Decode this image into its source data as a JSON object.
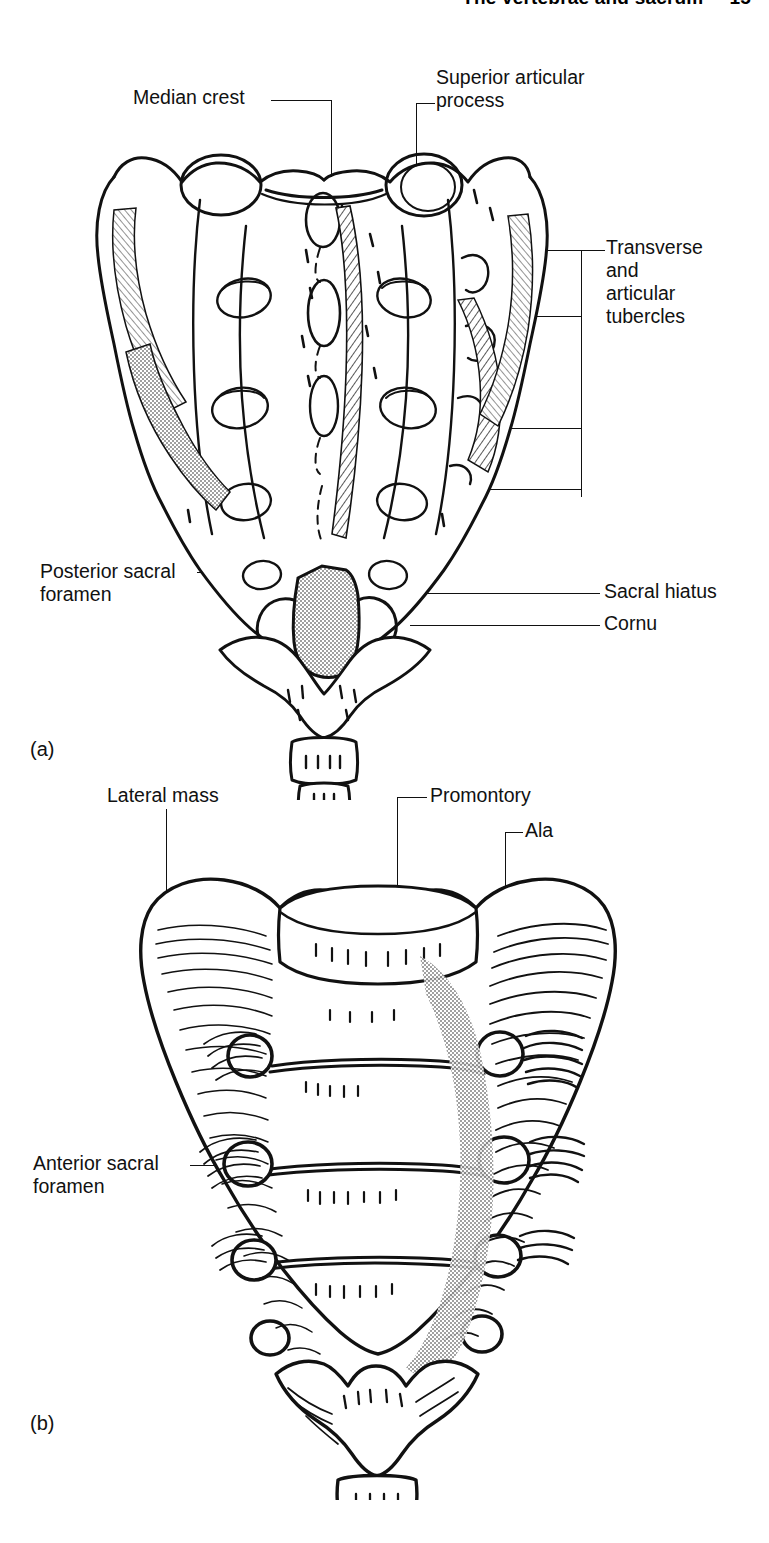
{
  "page": {
    "running_head": {
      "title": "The vertebrae and sacrum",
      "page_number": "15"
    },
    "width": 769,
    "height": 1543,
    "background": "#ffffff",
    "ink": "#000000"
  },
  "figure": {
    "caption_ids": {
      "panel_a": "(a)",
      "panel_b": "(b)"
    },
    "panels": [
      {
        "id": "(a)",
        "view": "posterior surface of sacrum and coccyx",
        "labels": [
          {
            "name": "median-crest",
            "text": "Median crest"
          },
          {
            "name": "superior-articular-process",
            "text": "Superior articular\nprocess",
            "lines": [
              "Superior articular",
              "process"
            ]
          },
          {
            "name": "transverse-and-articular-tubercles",
            "text": "Transverse\nand\narticular\ntubercles",
            "lines": [
              "Transverse",
              "and",
              "articular",
              "tubercles"
            ]
          },
          {
            "name": "posterior-sacral-foramen",
            "text": "Posterior sacral\nforamen",
            "lines": [
              "Posterior sacral",
              "foramen"
            ]
          },
          {
            "name": "sacral-hiatus",
            "text": "Sacral hiatus"
          },
          {
            "name": "cornu",
            "text": "Cornu"
          }
        ]
      },
      {
        "id": "(b)",
        "view": "anterior (pelvic) surface of sacrum and coccyx",
        "labels": [
          {
            "name": "lateral-mass",
            "text": "Lateral mass"
          },
          {
            "name": "promontory",
            "text": "Promontory"
          },
          {
            "name": "ala",
            "text": "Ala"
          },
          {
            "name": "anterior-sacral-foramen",
            "text": "Anterior sacral\nforamen",
            "lines": [
              "Anterior sacral",
              "foramen"
            ]
          }
        ]
      }
    ]
  },
  "label_text": {
    "median_crest": "Median crest",
    "superior_articular_1": "Superior articular",
    "superior_articular_2": "process",
    "transverse_1": "Transverse",
    "transverse_2": "and",
    "transverse_3": "articular",
    "transverse_4": "tubercles",
    "posterior_sacral_1": "Posterior sacral",
    "posterior_sacral_2": "foramen",
    "sacral_hiatus": "Sacral hiatus",
    "cornu": "Cornu",
    "lateral_mass": "Lateral mass",
    "promontory": "Promontory",
    "ala": "Ala",
    "anterior_sacral_1": "Anterior sacral",
    "anterior_sacral_2": "foramen",
    "panel_a": "(a)",
    "panel_b": "(b)"
  }
}
